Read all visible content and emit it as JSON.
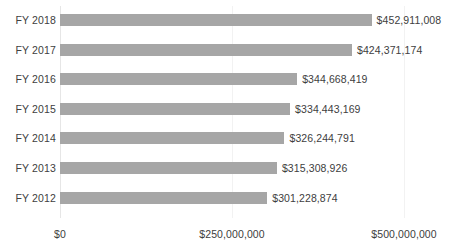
{
  "chart_data": {
    "type": "bar",
    "orientation": "horizontal",
    "title": "",
    "subtitle": "",
    "xlabel": "",
    "ylabel": "",
    "categories": [
      "FY 2018",
      "FY 2017",
      "FY 2016",
      "FY 2015",
      "FY 2014",
      "FY 2013",
      "FY 2012"
    ],
    "values": [
      452911008,
      424371174,
      344668419,
      334443169,
      326244791,
      315308926,
      301228874
    ],
    "data_labels": [
      "$452,911,008",
      "$424,371,174",
      "$344,668,419",
      "$334,443,169",
      "$326,244,791",
      "$315,308,926",
      "$301,228,874"
    ],
    "xlim": [
      0,
      500000000
    ],
    "xticks": [
      0,
      250000000,
      500000000
    ],
    "xtick_labels": [
      "$0",
      "$250,000,000",
      "$500,000,000"
    ],
    "grid": true,
    "grid_axis": "x",
    "legend": false,
    "legend_position": "none",
    "bar_color": "#a6a6a6",
    "text_color": "#404040",
    "gridline_color": "#f2f2f2",
    "background_color": "#ffffff"
  },
  "axis": {
    "ticks": [
      {
        "label": "$0",
        "value": 0
      },
      {
        "label": "$250,000,000",
        "value": 250000000
      },
      {
        "label": "$500,000,000",
        "value": 500000000
      }
    ]
  },
  "rows": [
    {
      "category": "FY 2018",
      "value": 452911008,
      "label": "$452,911,008"
    },
    {
      "category": "FY 2017",
      "value": 424371174,
      "label": "$424,371,174"
    },
    {
      "category": "FY 2016",
      "value": 344668419,
      "label": "$344,668,419"
    },
    {
      "category": "FY 2015",
      "value": 334443169,
      "label": "$334,443,169"
    },
    {
      "category": "FY 2014",
      "value": 326244791,
      "label": "$326,244,791"
    },
    {
      "category": "FY 2013",
      "value": 315308926,
      "label": "$315,308,926"
    },
    {
      "category": "FY 2012",
      "value": 301228874,
      "label": "$301,228,874"
    }
  ]
}
